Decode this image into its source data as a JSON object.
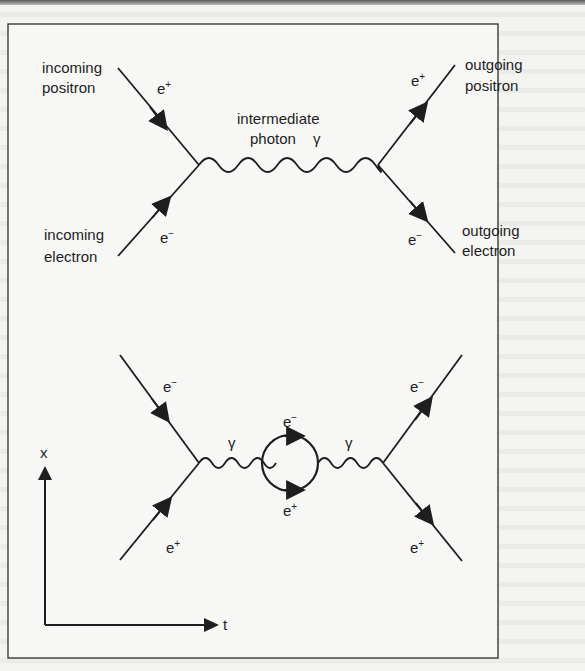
{
  "figure": {
    "colors": {
      "ink": "#1e1e1e",
      "paper": "#f3f3f1",
      "frame": "#3a3a3a"
    },
    "top_diagram": {
      "incoming_positron_label": [
        "incoming",
        "positron"
      ],
      "incoming_electron_label": [
        "incoming",
        "electron"
      ],
      "outgoing_positron_label": [
        "outgoing",
        "positron"
      ],
      "outgoing_electron_label": [
        "outgoing",
        "electron"
      ],
      "photon_label": [
        "intermediate",
        "photon"
      ],
      "photon_symbol": "γ",
      "incoming_positron_symbol": {
        "base": "e",
        "sup": "+"
      },
      "incoming_electron_symbol": {
        "base": "e",
        "sup": "−"
      },
      "outgoing_positron_symbol": {
        "base": "e",
        "sup": "+"
      },
      "outgoing_electron_symbol": {
        "base": "e",
        "sup": "−"
      }
    },
    "bottom_diagram": {
      "incoming_upper_symbol": {
        "base": "e",
        "sup": "−"
      },
      "incoming_lower_symbol": {
        "base": "e",
        "sup": "+"
      },
      "outgoing_upper_symbol": {
        "base": "e",
        "sup": "−"
      },
      "outgoing_lower_symbol": {
        "base": "e",
        "sup": "+"
      },
      "left_photon_symbol": "γ",
      "right_photon_symbol": "γ",
      "loop_top_symbol": {
        "base": "e",
        "sup": "−"
      },
      "loop_bottom_symbol": {
        "base": "e",
        "sup": "+"
      }
    },
    "axes": {
      "vertical_label": "x",
      "horizontal_label": "t"
    }
  }
}
